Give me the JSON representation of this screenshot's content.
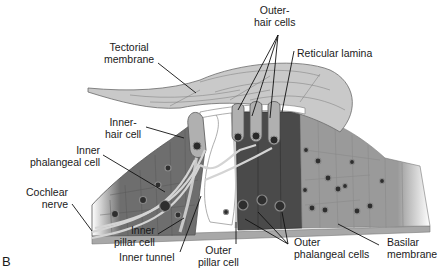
{
  "figure": {
    "panel_letter": "B",
    "labels": {
      "tectorial_membrane": "Tectorial\nmembrane",
      "outer_hair_cells": "Outer-\nhair cells",
      "reticular_lamina": "Reticular lamina",
      "inner_hair_cell": "Inner-\nhair cell",
      "inner_phalangeal_cell": "Inner\nphalangeal cell",
      "cochlear_nerve": "Cochlear\nnerve",
      "inner_pillar_cell": "Inner\npillar cell",
      "inner_tunnel": "Inner tunnel",
      "outer_pillar_cell": "Outer\npillar cell",
      "outer_phalangeal_cells": "Outer\nphalangeal cells",
      "basilar_membrane": "Basilar\nmembrane"
    },
    "colors": {
      "tectorial": "#c9c9c9",
      "tectorial_stroke": "#6a6a6a",
      "inner_cells": "#6e6e6e",
      "outer_phalangeal": "#4a4a4a",
      "hensen_cells": "#bdbdbd",
      "hair_cell": "#b0b0b0",
      "nucleus": "#2a2a2a",
      "leader": "#111111"
    }
  }
}
